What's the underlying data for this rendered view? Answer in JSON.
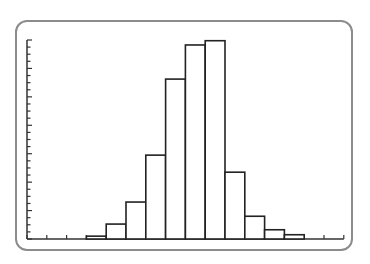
{
  "chart_data": {
    "type": "bar",
    "title": "",
    "xlabel": "",
    "ylabel": "",
    "categories": [
      "1",
      "2",
      "3",
      "4",
      "5",
      "6",
      "7",
      "8",
      "9",
      "10",
      "11"
    ],
    "values": [
      0.4,
      2.1,
      5.2,
      11.8,
      22.5,
      27.3,
      27.9,
      9.4,
      3.2,
      1.3,
      0.6
    ],
    "ylim": [
      0,
      28
    ],
    "y_minor_tick_step": 1,
    "y_major_tick_step": 4,
    "x_empty_bins_before": 3,
    "x_empty_bins_after": 2,
    "grid": false,
    "legend": "none",
    "colors": {
      "bar_fill": "#ffffff",
      "bar_stroke": "#222222",
      "axis": "#333333",
      "frame": "#8c8c8c"
    }
  }
}
